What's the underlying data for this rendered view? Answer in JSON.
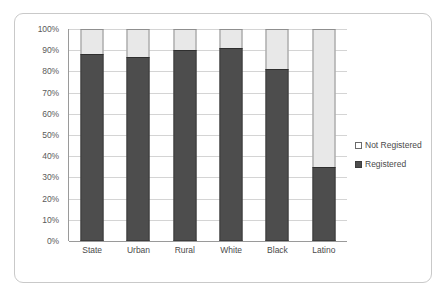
{
  "chart_data": {
    "type": "bar",
    "subtype": "stacked-100-percent",
    "title": "",
    "xlabel": "",
    "ylabel": "",
    "ylim": [
      0,
      100
    ],
    "yticks": [
      "0%",
      "10%",
      "20%",
      "30%",
      "40%",
      "50%",
      "60%",
      "70%",
      "80%",
      "90%",
      "100%"
    ],
    "grid": true,
    "legend_position": "right",
    "categories": [
      "State",
      "Urban",
      "Rural",
      "White",
      "Black",
      "Latino"
    ],
    "series": [
      {
        "name": "Registered",
        "color": "#4d4d4d",
        "values": [
          88,
          87,
          90,
          91,
          81,
          35
        ]
      },
      {
        "name": "Not Registered",
        "color": "#e8e8e8",
        "values": [
          12,
          13,
          10,
          9,
          19,
          65
        ]
      }
    ]
  },
  "legend": {
    "entries": [
      {
        "label": "Not Registered",
        "swatch": "hollow-square-icon"
      },
      {
        "label": "Registered",
        "swatch": "filled-square-icon"
      }
    ]
  },
  "colors": {
    "registered": "#4d4d4d",
    "not_registered": "#e8e8e8",
    "gridline": "#d4d4d4",
    "axis": "#9a9a9a",
    "card_border": "#c9c9c9",
    "text": "#4a4a4a"
  }
}
